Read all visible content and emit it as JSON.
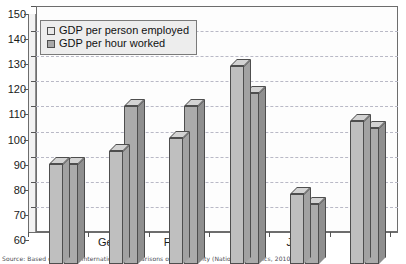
{
  "chart_data": {
    "type": "bar",
    "title": "",
    "xlabel": "",
    "ylabel": "",
    "ylim": [
      60,
      150
    ],
    "yticks": [
      60,
      70,
      80,
      90,
      100,
      110,
      120,
      130,
      140,
      150
    ],
    "grid": true,
    "legend_position": "top-left",
    "categories": [
      "UK",
      "Germany",
      "France",
      "USA",
      "Japan",
      "G7"
    ],
    "series": [
      {
        "name": "GDP per person employed",
        "values": [
          100,
          105,
          110,
          139,
          88,
          117
        ]
      },
      {
        "name": "GDP per hour worked",
        "values": [
          100,
          123,
          123,
          128,
          84,
          114
        ]
      }
    ],
    "source": "Source: Based on data in International Comparisons of Productivity (National Statistics, 2010)"
  },
  "legend": {
    "items": [
      {
        "label": "GDP per person employed",
        "color": "#e8e8e8"
      },
      {
        "label": "GDP per hour worked",
        "color": "#a8a8a8"
      }
    ]
  },
  "axis": {
    "y_tick_labels": [
      "150",
      "140",
      "130",
      "120",
      "110",
      "100",
      "90",
      "80",
      "70",
      "60"
    ],
    "x_tick_labels": [
      "UK",
      "Germany",
      "France",
      "USA",
      "Japan",
      "G7"
    ]
  }
}
